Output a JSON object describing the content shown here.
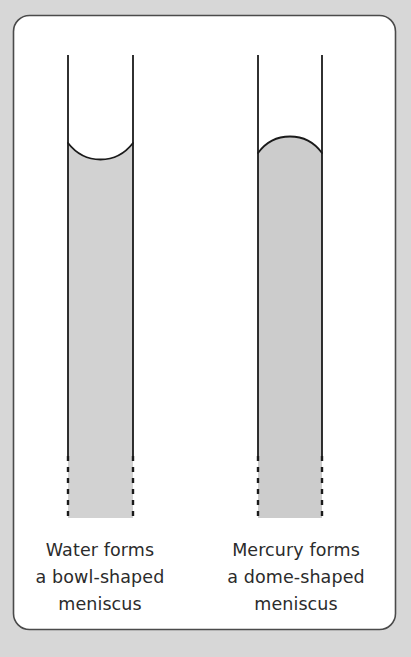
{
  "figure": {
    "background_color": "#d7d7d7",
    "card": {
      "fill": "#ffffff",
      "stroke": "#444444",
      "corner_radius": 15
    }
  },
  "panels": [
    {
      "id": "water",
      "substance": "Water",
      "meniscus_type": "concave",
      "meniscus_shape_word": "bowl-shaped",
      "liquid_fill": "#d2d2d2",
      "tube_stroke": "#1a1a1a",
      "caption_lines": [
        "Water forms",
        "a bowl-shaped",
        "meniscus"
      ]
    },
    {
      "id": "mercury",
      "substance": "Mercury",
      "meniscus_type": "convex",
      "meniscus_shape_word": "dome-shaped",
      "liquid_fill": "#cccccc",
      "tube_stroke": "#1a1a1a",
      "caption_lines": [
        "Mercury forms",
        "a dome-shaped",
        "meniscus"
      ]
    }
  ],
  "caption": {
    "water_line_1": "Water forms",
    "water_line_2": "a bowl-shaped",
    "water_line_3": "meniscus",
    "mercury_line_1": "Mercury forms",
    "mercury_line_2": "a dome-shaped",
    "mercury_line_3": "meniscus"
  }
}
